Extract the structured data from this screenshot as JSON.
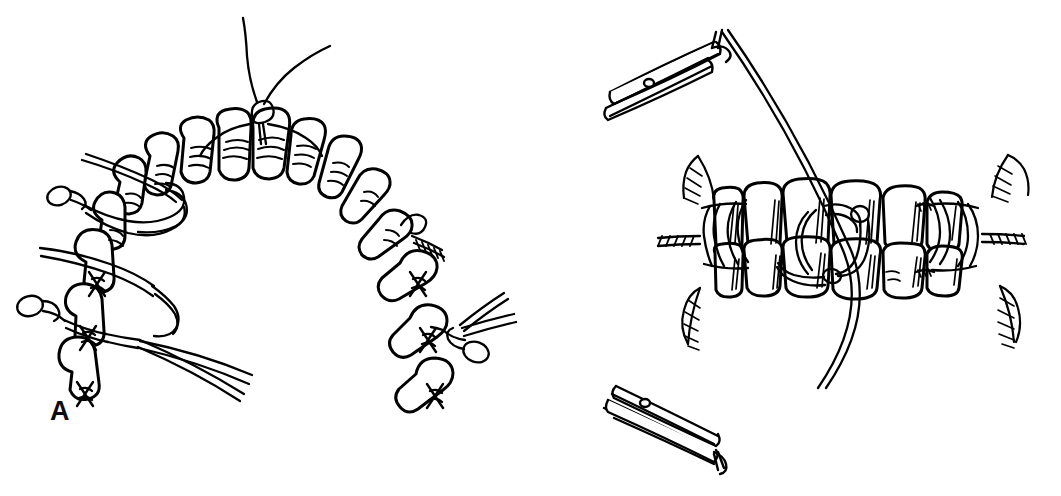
{
  "figure": {
    "style": "black-and-white pen-and-ink line drawing",
    "background_color": "#ffffff",
    "ink_color": "#000000",
    "width": 1061,
    "height": 496,
    "caption": ""
  },
  "panels": [
    {
      "id": "A",
      "label": "A",
      "label_x": 50,
      "label_y": 398,
      "view": "occlusal view of dental arch",
      "description": "Horseshoe-shaped dental arch seen from the occlusal surface with interdental eyelet (Ivy loop) wires placed around teeth; free wire ends and twisted pigtail loops project outward from the buccal side.",
      "tooth_count": 14,
      "wire_features": [
        "anterior eyelet loop between the central incisors with two long free wire ends crossing above",
        "left posterior eyelet loop with twisted pigtail terminal",
        "second left eyelet wire with long straight free end",
        "left molar eyelet loop with twisted pigtail and two long straight free wire ends",
        "right premolar twisted wire end",
        "right molar eyelet loop with twisted pigtail and two long free wire ends"
      ]
    },
    {
      "id": "B",
      "label": "B",
      "label_x": 578,
      "label_y": 396,
      "view": "buccal (lateral) view of teeth in occlusion",
      "description": "Upper and lower posterior teeth in occlusion with eyelet wires on each arch and a single intermaxillary wire passed through the upper and lower eyelets; the wire ends are grasped by two needle holders above and below.",
      "upper_tooth_count": 5,
      "lower_tooth_count": 5,
      "instruments": [
        {
          "name": "needle-holder-upper",
          "position": "upper left",
          "holding": "free end of intermaxillary wire"
        },
        {
          "name": "needle-holder-lower",
          "position": "lower left",
          "holding": "free end of intermaxillary wire"
        }
      ],
      "wire_features": [
        "left eyelet wire ladder with twisted buccal pigtail",
        "central intermaxillary eyelet loop engaging upper and lower wires",
        "right eyelet wire ladder with twisted buccal pigtail",
        "long intermaxillary wire running diagonally from upper instrument, through the eyelets, down to lower instrument"
      ]
    }
  ]
}
